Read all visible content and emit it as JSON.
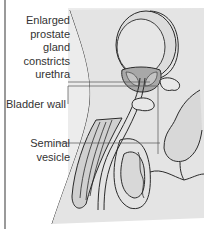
{
  "diagram": {
    "labels": {
      "prostate": [
        "Enlarged",
        "prostate",
        "gland",
        "constricts",
        "urethra"
      ],
      "bladder_wall": "Bladder wall",
      "seminal_vesicle": [
        "Seminal",
        "vesicle"
      ]
    },
    "colors": {
      "panel": "#ececec",
      "outline": "#2a2a2a",
      "organ_fill": "#d4d4d4",
      "dark_fill": "#a8a8a8",
      "leader_line": "#555555",
      "sidebar_bar": "#9a9a9a",
      "text": "#333333"
    }
  }
}
